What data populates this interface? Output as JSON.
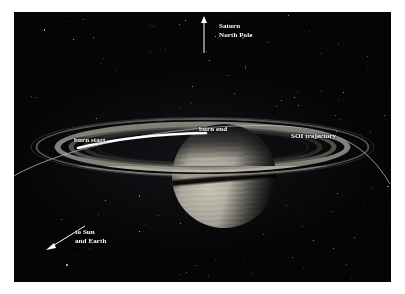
{
  "figure": {
    "background_color": "#050506",
    "page_color": "#ffffff"
  },
  "labels": {
    "north_pole": "Saturn\nNorth Pole",
    "burn_start": "burn start",
    "burn_end": "burn end",
    "soi_trajectory": "SOI trajectory",
    "to_sun_and_earth": "to Sun\nand Earth"
  },
  "annotations": {
    "north_pole_arrow": {
      "icon": "arrow-up-icon",
      "direction": "up",
      "color": "#ffffff"
    },
    "sun_earth_arrow": {
      "icon": "arrow-down-left-icon",
      "direction": "down-left",
      "color": "#ffffff"
    },
    "burn_arc": {
      "icon": "thick-arc-icon",
      "color": "#ffffff",
      "description": "thick white arc segment marking the SOI burn from burn start to burn end"
    },
    "trajectory_arc": {
      "icon": "thin-arc-icon",
      "color": "#b9bcc2",
      "description": "thin spacecraft trajectory arc crossing the ring plane"
    }
  },
  "scene": {
    "planet": {
      "name": "Saturn",
      "highlight_color": "#c8c3b6",
      "shadow_color": "#1b1a18"
    },
    "rings": {
      "bright_color": "#9b978d",
      "cassini_division_color": "#0d0d0f",
      "outer_faint_color": "#5a584f"
    },
    "starfield": {
      "star_color": "#ffffff",
      "count": 120
    }
  }
}
